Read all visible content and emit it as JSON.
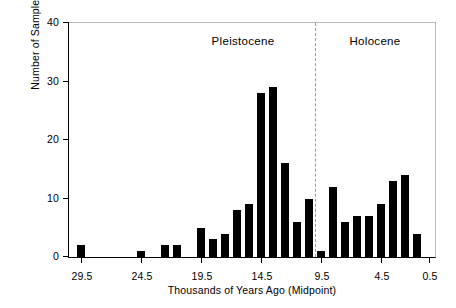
{
  "chart_data": {
    "type": "bar",
    "title": "",
    "subtitle": "",
    "xlabel": "Thousands of Years Ago (Midpoint)",
    "ylabel": "Number of Samples",
    "orientation": "vertical",
    "grid": false,
    "legend": null,
    "xlim": [
      30.5,
      0.0
    ],
    "ylim": [
      0,
      40
    ],
    "x_axis_direction": "decreasing",
    "bin_width": 1,
    "xticks": [
      "29.5",
      "24.5",
      "19.5",
      "14.5",
      "9.5",
      "4.5",
      "0.5"
    ],
    "xtick_values": [
      29.5,
      24.5,
      19.5,
      14.5,
      9.5,
      4.5,
      0.5
    ],
    "yticks": [
      "0",
      "10",
      "20",
      "30",
      "40"
    ],
    "ytick_values": [
      0,
      10,
      20,
      30,
      40
    ],
    "categories": [
      "29.5",
      "28.5",
      "27.5",
      "26.5",
      "25.5",
      "24.5",
      "23.5",
      "22.5",
      "21.5",
      "20.5",
      "19.5",
      "18.5",
      "17.5",
      "16.5",
      "15.5",
      "14.5",
      "13.5",
      "12.5",
      "11.5",
      "10.5",
      "9.5",
      "8.5",
      "7.5",
      "6.5",
      "5.5",
      "4.5",
      "3.5",
      "2.5",
      "1.5",
      "0.5"
    ],
    "values": [
      2,
      0,
      0,
      0,
      0,
      1,
      0,
      2,
      2,
      0,
      5,
      3,
      4,
      8,
      9,
      28,
      29,
      16,
      6,
      10,
      1,
      12,
      6,
      7,
      7,
      9,
      13,
      14,
      4,
      0
    ],
    "bar_color": "#000000",
    "annotations": [
      {
        "text": "Pleistocene",
        "x": 16.0,
        "y": 37
      },
      {
        "text": "Holocene",
        "x": 5.0,
        "y": 37
      }
    ],
    "divider": {
      "x": 10.0,
      "style": "dashed",
      "color": "#9a9a9a"
    }
  },
  "axes": {
    "frame_color": "#000000",
    "background": "#ffffff"
  }
}
